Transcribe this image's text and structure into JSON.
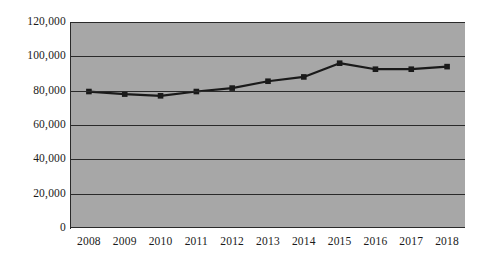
{
  "chart_data": {
    "type": "line",
    "title": "",
    "xlabel": "",
    "ylabel": "",
    "categories": [
      "2008",
      "2009",
      "2010",
      "2011",
      "2012",
      "2013",
      "2014",
      "2015",
      "2016",
      "2017",
      "2018"
    ],
    "values": [
      79500,
      78000,
      77000,
      79500,
      81500,
      85500,
      88000,
      96000,
      92500,
      92500,
      94000
    ],
    "series": [
      {
        "name": "Series 1",
        "values": [
          79500,
          78000,
          77000,
          79500,
          81500,
          85500,
          88000,
          96000,
          92500,
          92500,
          94000
        ]
      }
    ],
    "ylim": [
      0,
      120000
    ],
    "y_ticks": [
      0,
      20000,
      40000,
      60000,
      80000,
      100000,
      120000
    ],
    "y_tick_labels": [
      "0",
      "20,000",
      "40,000",
      "60,000",
      "80,000",
      "100,000",
      "120,000"
    ],
    "grid": true,
    "legend": false,
    "legend_position": "none",
    "marker": "square",
    "line_color": "#1a1a1a",
    "marker_color": "#1a1a1a",
    "plot_background": "#a7a7a7",
    "gridline_color": "#2a2a2a",
    "figure_background": "#ffffff"
  }
}
